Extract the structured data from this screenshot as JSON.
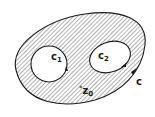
{
  "figure": {
    "colors": {
      "ink": "#1a1a1a",
      "hatch": "#555555",
      "background": "#ffffff"
    },
    "labels": {
      "outer_contour": {
        "base": "c",
        "sub": ""
      },
      "inner_contour_1": {
        "base": "c",
        "sub": "1"
      },
      "inner_contour_2": {
        "base": "c",
        "sub": "2"
      },
      "point": {
        "marker": "°",
        "base": "z",
        "sub": "0"
      }
    }
  }
}
